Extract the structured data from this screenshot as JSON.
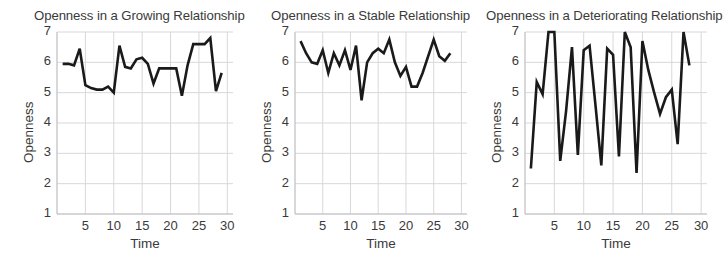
{
  "figure": {
    "background_color": "#ffffff",
    "line_color": "#1a1a1a",
    "grid_color": "#d8d8dc",
    "axis_color": "#c8c8cc",
    "text_color": "#3a3a3a"
  },
  "chart_data": [
    {
      "type": "line",
      "title": "Openness in a Growing Relationship",
      "xlabel": "Time",
      "ylabel": "Openness",
      "xlim": [
        0,
        31
      ],
      "ylim": [
        1,
        7
      ],
      "xticks": [
        5,
        10,
        15,
        20,
        25,
        30
      ],
      "yticks": [
        1,
        2,
        3,
        4,
        5,
        6,
        7
      ],
      "grid": true,
      "legend": null,
      "x": [
        1,
        2,
        3,
        4,
        5,
        6,
        7,
        8,
        9,
        10,
        11,
        12,
        13,
        14,
        15,
        16,
        17,
        18,
        19,
        20,
        21,
        22,
        23,
        24,
        25,
        26,
        27,
        28,
        29
      ],
      "values": [
        5.95,
        5.95,
        5.9,
        6.45,
        5.25,
        5.15,
        5.1,
        5.1,
        5.2,
        5.0,
        6.55,
        5.85,
        5.8,
        6.1,
        6.15,
        5.95,
        5.3,
        5.8,
        5.8,
        5.8,
        5.8,
        4.9,
        5.9,
        6.6,
        6.6,
        6.6,
        6.8,
        5.05,
        5.65
      ]
    },
    {
      "type": "line",
      "title": "Openness in a Stable Relationship",
      "xlabel": "Time",
      "ylabel": "Openness",
      "xlim": [
        0,
        31
      ],
      "ylim": [
        1,
        7
      ],
      "xticks": [
        5,
        10,
        15,
        20,
        25,
        30
      ],
      "yticks": [
        1,
        2,
        3,
        4,
        5,
        6,
        7
      ],
      "grid": true,
      "legend": null,
      "x": [
        1,
        2,
        3,
        4,
        5,
        6,
        7,
        8,
        9,
        10,
        11,
        12,
        13,
        14,
        15,
        16,
        17,
        18,
        19,
        20,
        21,
        22,
        23,
        24,
        25,
        26,
        27,
        28
      ],
      "values": [
        6.7,
        6.3,
        6.0,
        5.95,
        6.4,
        5.65,
        6.3,
        5.9,
        6.4,
        5.75,
        6.55,
        4.75,
        6.0,
        6.3,
        6.45,
        6.3,
        6.75,
        6.0,
        5.55,
        5.85,
        5.2,
        5.2,
        5.65,
        6.2,
        6.75,
        6.2,
        6.05,
        6.3
      ]
    },
    {
      "type": "line",
      "title": "Openness in a Deteriorating Relationship",
      "xlabel": "Time",
      "ylabel": "Openness",
      "xlim": [
        0,
        31
      ],
      "ylim": [
        1,
        7
      ],
      "xticks": [
        5,
        10,
        15,
        20,
        25,
        30
      ],
      "yticks": [
        1,
        2,
        3,
        4,
        5,
        6,
        7
      ],
      "grid": true,
      "legend": null,
      "x": [
        1,
        2,
        3,
        4,
        5,
        6,
        7,
        8,
        9,
        10,
        11,
        12,
        13,
        14,
        15,
        16,
        17,
        18,
        19,
        20,
        21,
        22,
        23,
        24,
        25,
        26,
        27,
        28
      ],
      "values": [
        2.5,
        5.35,
        4.95,
        7.0,
        7.0,
        2.75,
        4.4,
        6.5,
        2.95,
        6.4,
        6.55,
        4.6,
        2.6,
        6.45,
        6.25,
        2.9,
        7.0,
        6.5,
        2.35,
        6.7,
        5.75,
        5.0,
        4.3,
        4.85,
        5.1,
        3.3,
        7.0,
        5.9
      ]
    }
  ]
}
